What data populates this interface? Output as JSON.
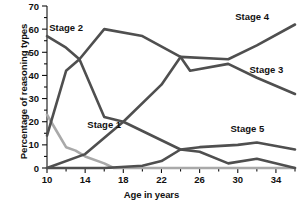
{
  "chart_data": {
    "type": "line",
    "title": "",
    "xlabel": "Age in years",
    "ylabel": "Percentage of reasoning types",
    "xlim": [
      10,
      36
    ],
    "ylim": [
      0,
      70
    ],
    "x_ticks": [
      10,
      14,
      18,
      22,
      26,
      30,
      34
    ],
    "x_minor_ticks": [
      12,
      16,
      20,
      24,
      28,
      32,
      36
    ],
    "y_ticks": [
      0,
      10,
      20,
      30,
      40,
      50,
      60,
      70
    ],
    "y_minor_ticks": [
      5,
      15,
      25,
      35,
      45,
      55,
      65
    ],
    "grid": false,
    "legend_position": "inline-labels",
    "series": [
      {
        "name": "Stage 1",
        "color": "#a9a9a9",
        "label_x": 16.0,
        "label_y": 17.5,
        "points": [
          {
            "x": 10,
            "y": 23
          },
          {
            "x": 11,
            "y": 16
          },
          {
            "x": 12,
            "y": 9
          },
          {
            "x": 13,
            "y": 7.5
          },
          {
            "x": 14,
            "y": 5
          },
          {
            "x": 16,
            "y": 2
          },
          {
            "x": 17,
            "y": 0
          },
          {
            "x": 36,
            "y": 0
          }
        ]
      },
      {
        "name": "Stage 2",
        "color": "#4f4f4f",
        "label_x": 12.0,
        "label_y": 59.0,
        "points": [
          {
            "x": 10,
            "y": 57
          },
          {
            "x": 12,
            "y": 52
          },
          {
            "x": 13.4,
            "y": 47
          },
          {
            "x": 16,
            "y": 22
          },
          {
            "x": 18,
            "y": 20
          },
          {
            "x": 20,
            "y": 16
          },
          {
            "x": 22,
            "y": 12
          },
          {
            "x": 24,
            "y": 8
          },
          {
            "x": 26,
            "y": 7
          },
          {
            "x": 29,
            "y": 2
          },
          {
            "x": 32,
            "y": 4
          },
          {
            "x": 36,
            "y": 0
          }
        ]
      },
      {
        "name": "Stage 3",
        "color": "#4f4f4f",
        "label_x": 33.0,
        "label_y": 41.0,
        "points": [
          {
            "x": 10,
            "y": 14
          },
          {
            "x": 12,
            "y": 42
          },
          {
            "x": 13.4,
            "y": 47
          },
          {
            "x": 16,
            "y": 60
          },
          {
            "x": 20,
            "y": 57
          },
          {
            "x": 24,
            "y": 48
          },
          {
            "x": 25,
            "y": 42
          },
          {
            "x": 29,
            "y": 45
          },
          {
            "x": 32,
            "y": 39
          },
          {
            "x": 36,
            "y": 32
          }
        ]
      },
      {
        "name": "Stage 4",
        "color": "#4f4f4f",
        "label_x": 31.5,
        "label_y": 64.0,
        "points": [
          {
            "x": 10,
            "y": 0
          },
          {
            "x": 14,
            "y": 6
          },
          {
            "x": 18,
            "y": 20
          },
          {
            "x": 22,
            "y": 36
          },
          {
            "x": 24,
            "y": 48
          },
          {
            "x": 29,
            "y": 47
          },
          {
            "x": 32,
            "y": 53
          },
          {
            "x": 36,
            "y": 62
          }
        ]
      },
      {
        "name": "Stage 5",
        "color": "#4f4f4f",
        "label_x": 31.0,
        "label_y": 15.5,
        "points": [
          {
            "x": 10,
            "y": 0
          },
          {
            "x": 16,
            "y": 0
          },
          {
            "x": 20,
            "y": 1
          },
          {
            "x": 22,
            "y": 3
          },
          {
            "x": 24,
            "y": 8
          },
          {
            "x": 26,
            "y": 9
          },
          {
            "x": 30,
            "y": 10
          },
          {
            "x": 32,
            "y": 11
          },
          {
            "x": 36,
            "y": 8
          }
        ]
      }
    ]
  }
}
